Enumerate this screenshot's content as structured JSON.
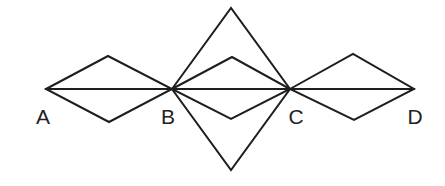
{
  "diagram": {
    "stroke_color": "#1e1e1e",
    "stroke_width": 2,
    "points": {
      "A": [
        46,
        89
      ],
      "B": [
        172,
        89
      ],
      "C": [
        290,
        89
      ],
      "D": [
        414,
        89
      ]
    },
    "baseline": {
      "from": "A",
      "to": "D"
    },
    "small_rhombi": [
      {
        "name": "rhombus-AB",
        "left": [
          46,
          89
        ],
        "top": [
          108,
          56
        ],
        "right": [
          172,
          89
        ],
        "bottom": [
          109,
          122
        ]
      },
      {
        "name": "rhombus-BC",
        "left": [
          172,
          89
        ],
        "top": [
          232,
          57
        ],
        "right": [
          290,
          89
        ],
        "bottom": [
          231,
          119
        ]
      },
      {
        "name": "rhombus-CD",
        "left": [
          290,
          89
        ],
        "top": [
          353,
          54
        ],
        "right": [
          414,
          89
        ],
        "bottom": [
          354,
          120
        ]
      }
    ],
    "large_rhombus": {
      "left": [
        172,
        89
      ],
      "top": [
        231,
        8
      ],
      "right": [
        290,
        89
      ],
      "bottom": [
        231,
        170
      ]
    },
    "labels": [
      {
        "text": "A",
        "x": 43,
        "y": 116
      },
      {
        "text": "B",
        "x": 168,
        "y": 116
      },
      {
        "text": "C",
        "x": 296,
        "y": 116
      },
      {
        "text": "D",
        "x": 415,
        "y": 116
      }
    ]
  }
}
